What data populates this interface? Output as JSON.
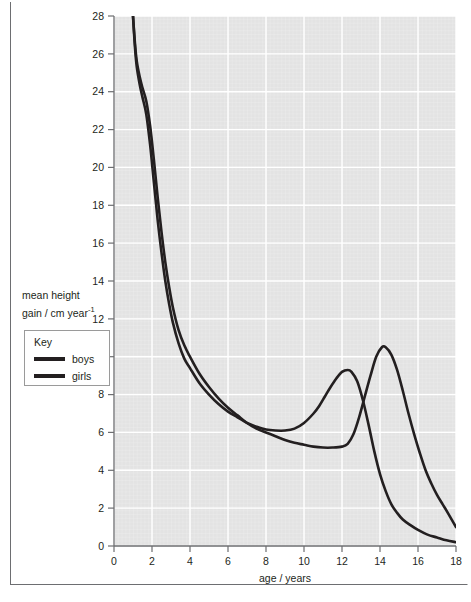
{
  "chart_data": {
    "type": "line",
    "title": "",
    "xlabel": "age / years",
    "ylabel": "mean height gain / cm year",
    "ylabel_exponent": "-1",
    "xlim": [
      0,
      18
    ],
    "ylim": [
      0,
      28
    ],
    "xticks": [
      "0",
      "2",
      "4",
      "6",
      "8",
      "10",
      "12",
      "14",
      "16",
      "18"
    ],
    "yticks": [
      "0",
      "2",
      "4",
      "6",
      "8",
      "10",
      "12",
      "14",
      "16",
      "18",
      "20",
      "22",
      "24",
      "26",
      "28"
    ],
    "grid": true,
    "grid_color": "#ffffff",
    "plot_background": "#e3e3e3",
    "line_color": "#231f20",
    "legend_position": "left-outside",
    "series": [
      {
        "name": "boys",
        "points": [
          [
            1.0,
            28.0
          ],
          [
            1.1,
            26.6
          ],
          [
            1.2,
            25.6
          ],
          [
            1.35,
            24.8
          ],
          [
            1.5,
            24.2
          ],
          [
            1.7,
            23.5
          ],
          [
            1.9,
            22.2
          ],
          [
            2.1,
            20.4
          ],
          [
            2.3,
            18.4
          ],
          [
            2.5,
            16.6
          ],
          [
            2.7,
            15.0
          ],
          [
            2.9,
            13.7
          ],
          [
            3.1,
            12.6
          ],
          [
            3.4,
            11.4
          ],
          [
            3.7,
            10.6
          ],
          [
            4.0,
            10.0
          ],
          [
            4.5,
            9.1
          ],
          [
            5.0,
            8.4
          ],
          [
            5.5,
            7.8
          ],
          [
            6.0,
            7.3
          ],
          [
            6.5,
            6.9
          ],
          [
            7.0,
            6.5
          ],
          [
            7.5,
            6.2
          ],
          [
            8.0,
            6.0
          ],
          [
            8.5,
            5.8
          ],
          [
            9.0,
            5.6
          ],
          [
            9.5,
            5.45
          ],
          [
            10.0,
            5.35
          ],
          [
            10.5,
            5.25
          ],
          [
            11.0,
            5.2
          ],
          [
            11.5,
            5.2
          ],
          [
            12.0,
            5.25
          ],
          [
            12.3,
            5.4
          ],
          [
            12.6,
            5.9
          ],
          [
            12.9,
            6.8
          ],
          [
            13.2,
            7.9
          ],
          [
            13.5,
            9.0
          ],
          [
            13.8,
            10.0
          ],
          [
            14.1,
            10.5
          ],
          [
            14.3,
            10.5
          ],
          [
            14.6,
            10.1
          ],
          [
            14.9,
            9.3
          ],
          [
            15.2,
            8.2
          ],
          [
            15.5,
            7.0
          ],
          [
            15.8,
            5.9
          ],
          [
            16.1,
            4.9
          ],
          [
            16.4,
            4.0
          ],
          [
            16.7,
            3.3
          ],
          [
            17.0,
            2.7
          ],
          [
            17.3,
            2.2
          ],
          [
            17.6,
            1.7
          ],
          [
            18.0,
            1.0
          ]
        ]
      },
      {
        "name": "girls",
        "points": [
          [
            1.0,
            28.0
          ],
          [
            1.1,
            26.4
          ],
          [
            1.2,
            25.3
          ],
          [
            1.35,
            24.4
          ],
          [
            1.5,
            23.7
          ],
          [
            1.7,
            22.8
          ],
          [
            1.9,
            21.2
          ],
          [
            2.1,
            19.2
          ],
          [
            2.3,
            17.2
          ],
          [
            2.5,
            15.5
          ],
          [
            2.7,
            14.0
          ],
          [
            2.9,
            12.8
          ],
          [
            3.1,
            11.8
          ],
          [
            3.4,
            10.7
          ],
          [
            3.7,
            9.9
          ],
          [
            4.0,
            9.4
          ],
          [
            4.5,
            8.6
          ],
          [
            5.0,
            8.0
          ],
          [
            5.5,
            7.5
          ],
          [
            6.0,
            7.1
          ],
          [
            6.5,
            6.8
          ],
          [
            7.0,
            6.5
          ],
          [
            7.5,
            6.3
          ],
          [
            8.0,
            6.15
          ],
          [
            8.5,
            6.1
          ],
          [
            9.0,
            6.1
          ],
          [
            9.5,
            6.2
          ],
          [
            10.0,
            6.5
          ],
          [
            10.5,
            7.0
          ],
          [
            10.8,
            7.4
          ],
          [
            11.1,
            7.9
          ],
          [
            11.4,
            8.4
          ],
          [
            11.7,
            8.85
          ],
          [
            12.0,
            9.2
          ],
          [
            12.3,
            9.3
          ],
          [
            12.5,
            9.2
          ],
          [
            12.8,
            8.7
          ],
          [
            13.1,
            7.7
          ],
          [
            13.4,
            6.4
          ],
          [
            13.7,
            5.0
          ],
          [
            14.0,
            3.8
          ],
          [
            14.3,
            2.9
          ],
          [
            14.6,
            2.2
          ],
          [
            14.9,
            1.75
          ],
          [
            15.2,
            1.4
          ],
          [
            15.6,
            1.1
          ],
          [
            16.0,
            0.85
          ],
          [
            16.5,
            0.6
          ],
          [
            17.0,
            0.45
          ],
          [
            17.5,
            0.3
          ],
          [
            18.0,
            0.2
          ]
        ]
      }
    ]
  },
  "legend": {
    "title": "Key",
    "items": [
      {
        "label": "boys"
      },
      {
        "label": "girls"
      }
    ]
  },
  "axis": {
    "y_title_line1": "mean height",
    "y_title_line2": "gain / cm year",
    "y_title_exponent": "-1",
    "x_title": "age / years"
  }
}
